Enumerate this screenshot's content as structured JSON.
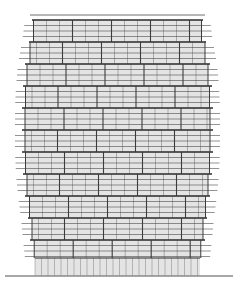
{
  "drawing": {
    "type": "architectural-elevation",
    "subject": "tower facade elevation",
    "colors": {
      "background": "#ffffff",
      "glass_fill": "#e4e4e4",
      "floor_line": "#4a4a4a",
      "band_line": "#2a2a2a",
      "mullion": "#3c3c3c",
      "ground_line": "#8a8a8a"
    },
    "geometry": {
      "roof_line": {
        "y": 15,
        "x1": 30,
        "x2": 205
      },
      "tower": {
        "top": 20,
        "bottom": 258
      },
      "podium": {
        "top": 258,
        "bottom": 276,
        "x1": 35,
        "x2": 200
      },
      "ground_line": {
        "y": 276,
        "x1": 5,
        "x2": 233
      },
      "floor_spacing": 5.5,
      "floors_per_band": 4,
      "mullion_spacing": 13,
      "floor_line_overhang": 10
    },
    "profile": [
      {
        "y": 20,
        "left": 35,
        "right": 200
      },
      {
        "y": 42,
        "left": 32,
        "right": 203
      },
      {
        "y": 64,
        "left": 28,
        "right": 207
      },
      {
        "y": 86,
        "left": 26,
        "right": 209
      },
      {
        "y": 108,
        "left": 25,
        "right": 210
      },
      {
        "y": 130,
        "left": 25,
        "right": 210
      },
      {
        "y": 152,
        "left": 25,
        "right": 210
      },
      {
        "y": 174,
        "left": 26,
        "right": 209
      },
      {
        "y": 196,
        "left": 28,
        "right": 207
      },
      {
        "y": 218,
        "left": 31,
        "right": 204
      },
      {
        "y": 240,
        "left": 33,
        "right": 202
      },
      {
        "y": 258,
        "left": 35,
        "right": 200
      }
    ]
  }
}
